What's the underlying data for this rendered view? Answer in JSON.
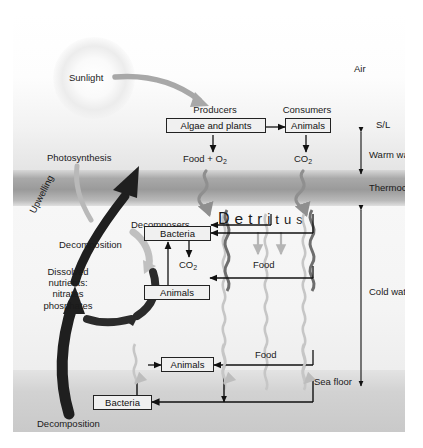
{
  "diagram": {
    "zones": {
      "air": "Air",
      "surface_marker": "S/L",
      "warm_water": "Warm water",
      "thermocline": "Thermocline",
      "cold_water": "Cold water",
      "sea_floor": "Sea floor"
    },
    "surface_layer": {
      "sunlight": "Sunlight",
      "photosynthesis": "Photosynthesis",
      "producers_heading": "Producers",
      "producers_box": "Algae and plants",
      "consumers_heading": "Consumers",
      "consumers_box": "Animals",
      "food_oxygen": "Food + O",
      "food_oxygen_sub": "2",
      "carbon_dioxide": "CO",
      "carbon_dioxide_sub": "2"
    },
    "detritus": {
      "label_letters": [
        "D",
        "e",
        "t",
        "r",
        "i",
        "t",
        "u",
        "s"
      ],
      "label_plain": "Detritus"
    },
    "mid_water": {
      "decomposers_heading": "Decomposers",
      "bacteria_box": "Bacteria",
      "co2_label": "CO",
      "co2_sub": "2",
      "animals_box": "Animals",
      "food_label": "Food"
    },
    "deep_water": {
      "animals_box": "Animals",
      "food_label": "Food"
    },
    "benthic": {
      "bacteria_box": "Bacteria",
      "decomposition": "Decomposition"
    },
    "nutrient_cycle": {
      "upwelling": "Upwelling",
      "decomposition": "Decomposition",
      "dissolved_line1": "Dissolved",
      "dissolved_line2": "nutrients:",
      "dissolved_line3": "nitrates",
      "dissolved_line4": "phosphates"
    },
    "colors": {
      "ink": "#1a1a1a",
      "box_fill": "#f0f0f0",
      "box_stroke": "#222222",
      "arrow_dark": "#111111",
      "arrow_gray": "#9a9a9a",
      "arrow_light": "#b5b5b5",
      "thermocline": "#9a9a9a",
      "sea_floor": "#c9c9c9"
    }
  }
}
